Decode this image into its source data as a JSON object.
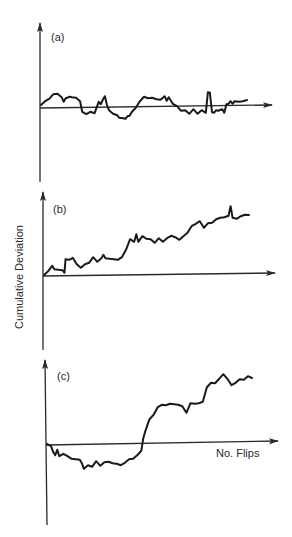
{
  "chart_data": {
    "type": "line",
    "ylabel": "Cumulative Deviation",
    "xlabel": "No. Flips",
    "grid": false,
    "panels": [
      {
        "label": "(a)",
        "xlim": [
          0,
          100
        ],
        "ylim": [
          -70,
          80
        ],
        "x": [
          0,
          2,
          4,
          6,
          8,
          10,
          11,
          12,
          14,
          15,
          17,
          19,
          20,
          22,
          24,
          26,
          28,
          29,
          30,
          31,
          32,
          33,
          35,
          37,
          38,
          40,
          41,
          42,
          43,
          44,
          46,
          48,
          50,
          52,
          54,
          56,
          58,
          60,
          61,
          62,
          64,
          66,
          68,
          70,
          72,
          74,
          76,
          78,
          80,
          81,
          82,
          83,
          84,
          85,
          86,
          88,
          89,
          90,
          91,
          92,
          93,
          94,
          96,
          98,
          100
        ],
        "values": [
          2,
          5,
          9,
          12,
          14,
          9,
          6,
          8,
          11,
          9,
          10,
          5,
          -4,
          -8,
          -4,
          -7,
          6,
          2,
          8,
          10,
          3,
          -4,
          -6,
          -9,
          -10,
          -12,
          -11,
          -10,
          -8,
          -6,
          0,
          5,
          11,
          8,
          10,
          7,
          8,
          10,
          7,
          9,
          4,
          0,
          -3,
          -4,
          -6,
          -3,
          -6,
          -4,
          -5,
          14,
          15,
          -6,
          -5,
          -4,
          -3,
          -3,
          -5,
          2,
          4,
          5,
          4,
          5,
          6,
          5,
          7
        ]
      },
      {
        "label": "(b)",
        "xlim": [
          0,
          100
        ],
        "ylim": [
          -70,
          90
        ],
        "x": [
          0,
          2,
          4,
          5,
          7,
          9,
          10,
          10.5,
          12,
          13,
          14,
          16,
          18,
          20,
          22,
          24,
          26,
          28,
          29,
          30,
          32,
          34,
          36,
          38,
          40,
          42,
          44,
          45,
          46,
          48,
          50,
          52,
          54,
          56,
          58,
          60,
          62,
          64,
          66,
          68,
          70,
          72,
          74,
          76,
          78,
          80,
          82,
          84,
          86,
          88,
          90,
          91,
          92,
          93,
          94,
          96,
          98,
          100
        ],
        "values": [
          0,
          3,
          10,
          5,
          6,
          4,
          3,
          15,
          16,
          15,
          18,
          10,
          8,
          10,
          13,
          17,
          14,
          16,
          21,
          16,
          17,
          15,
          16,
          17,
          26,
          35,
          34,
          40,
          34,
          38,
          37,
          35,
          33,
          36,
          34,
          36,
          40,
          37,
          36,
          38,
          43,
          48,
          52,
          53,
          48,
          51,
          53,
          55,
          58,
          57,
          60,
          68,
          58,
          56,
          57,
          58,
          61,
          60
        ]
      },
      {
        "label": "(c)",
        "xlim": [
          0,
          100
        ],
        "ylim": [
          -80,
          85
        ],
        "x": [
          0,
          2,
          3,
          4,
          5,
          6,
          8,
          10,
          12,
          14,
          16,
          17,
          18,
          20,
          22,
          24,
          26,
          28,
          30,
          32,
          34,
          36,
          38,
          40,
          42,
          44,
          46,
          47,
          48,
          50,
          52,
          54,
          56,
          58,
          60,
          62,
          64,
          66,
          68,
          70,
          72,
          74,
          76,
          78,
          80,
          82,
          84,
          86,
          88,
          90,
          92,
          94,
          96,
          98,
          100
        ],
        "values": [
          0,
          -3,
          -7,
          -12,
          -5,
          -13,
          -9,
          -13,
          -14,
          -16,
          -15,
          -20,
          -24,
          -22,
          -22,
          -18,
          -21,
          -19,
          -17,
          -20,
          -19,
          -22,
          -18,
          -16,
          -14,
          -12,
          -6,
          5,
          14,
          24,
          30,
          36,
          40,
          38,
          41,
          39,
          40,
          37,
          32,
          40,
          41,
          40,
          43,
          56,
          62,
          60,
          66,
          69,
          66,
          58,
          62,
          64,
          65,
          67,
          66
        ]
      }
    ]
  }
}
